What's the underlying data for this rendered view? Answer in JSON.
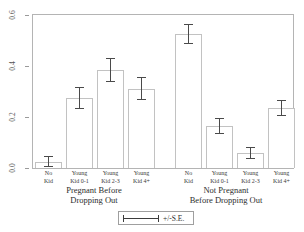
{
  "chart_data": {
    "type": "bar",
    "title": "",
    "subtitle": "",
    "xlabel": "",
    "ylabel": "",
    "ylim": [
      0.0,
      0.6
    ],
    "yticks": [
      "0.0",
      "0.2",
      "0.4",
      "0.6"
    ],
    "ytick_values": [
      0.0,
      0.2,
      0.4,
      0.6
    ],
    "grid": false,
    "legend_position": "bottom-center",
    "legend_entries": [
      "+/-S.E."
    ],
    "error_bar_type": "+/-S.E.",
    "groups": [
      {
        "label": "Pregnant Before\nDropping Out",
        "categories": [
          "No\nKid",
          "Young\nKid 0-1",
          "Young\nKid 2-3",
          "Young\nKid 4+"
        ],
        "values": [
          0.025,
          0.275,
          0.385,
          0.31
        ],
        "errors": [
          0.022,
          0.042,
          0.048,
          0.045
        ]
      },
      {
        "label": "Not Pregnant\nBefore Dropping Out",
        "categories": [
          "No\nKid",
          "Young\nKid 0-1",
          "Young\nKid 2-3",
          "Young\nKid 4+"
        ],
        "values": [
          0.525,
          0.165,
          0.06,
          0.235
        ],
        "errors": [
          0.04,
          0.032,
          0.024,
          0.03
        ]
      }
    ],
    "categories": [
      "No Kid",
      "Young Kid 0-1",
      "Young Kid 2-3",
      "Young Kid 4+",
      "No Kid",
      "Young Kid 0-1",
      "Young Kid 2-3",
      "Young Kid 4+"
    ],
    "values": [
      0.025,
      0.275,
      0.385,
      0.31,
      0.525,
      0.165,
      0.06,
      0.235
    ],
    "errors": [
      0.022,
      0.042,
      0.048,
      0.045,
      0.04,
      0.032,
      0.024,
      0.03
    ]
  },
  "legend": {
    "label": "+/-S.E."
  },
  "colors": {
    "bar_fill": "#ffffff",
    "bar_stroke": "#c2c2c2",
    "error_bar": "#4a4a4a",
    "frame": "#b4b4b4",
    "text": "#2d2d2d",
    "background": "#ffffff"
  }
}
